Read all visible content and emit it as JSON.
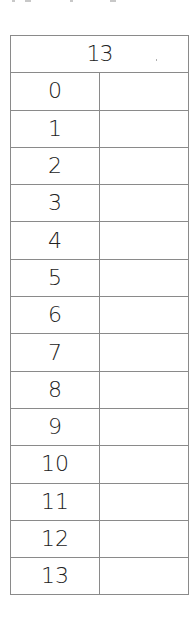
{
  "worksheet": {
    "header": "13",
    "rows": [
      {
        "number": "0",
        "answer": ""
      },
      {
        "number": "1",
        "answer": ""
      },
      {
        "number": "2",
        "answer": ""
      },
      {
        "number": "3",
        "answer": ""
      },
      {
        "number": "4",
        "answer": ""
      },
      {
        "number": "5",
        "answer": ""
      },
      {
        "number": "6",
        "answer": ""
      },
      {
        "number": "7",
        "answer": ""
      },
      {
        "number": "8",
        "answer": ""
      },
      {
        "number": "9",
        "answer": ""
      },
      {
        "number": "10",
        "answer": ""
      },
      {
        "number": "11",
        "answer": ""
      },
      {
        "number": "12",
        "answer": ""
      },
      {
        "number": "13",
        "answer": ""
      }
    ]
  },
  "colors": {
    "line": "#8a8a8a",
    "text": "#222222",
    "background": "#ffffff"
  }
}
